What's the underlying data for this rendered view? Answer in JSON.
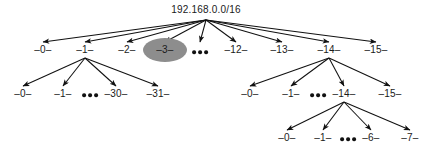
{
  "figure": {
    "title_text": "192.168.0.0/16",
    "background_color": "#ffffff",
    "ink_color": "#1a1a1a",
    "highlight_color": "#8d8d8d"
  },
  "tree": {
    "root": {
      "label": "192.168.0.0/16",
      "x": 206,
      "y": 10
    },
    "level2": [
      {
        "label": "–0–",
        "x": 43,
        "y": 50,
        "highlighted": false
      },
      {
        "label": "–1–",
        "x": 85,
        "y": 50,
        "highlighted": false
      },
      {
        "label": "–2–",
        "x": 127,
        "y": 50,
        "highlighted": false
      },
      {
        "label": "–3–",
        "x": 165,
        "y": 50,
        "highlighted": true
      },
      {
        "label": "–12–",
        "x": 236,
        "y": 50,
        "highlighted": false
      },
      {
        "label": "–13–",
        "x": 282,
        "y": 50,
        "highlighted": false
      },
      {
        "label": "–14–",
        "x": 329,
        "y": 50,
        "highlighted": false
      },
      {
        "label": "–15–",
        "x": 376,
        "y": 50,
        "highlighted": false
      }
    ],
    "level2_ellipsis": {
      "x": 200,
      "y": 52,
      "dots": 3
    },
    "level3_left": [
      {
        "label": "–0–",
        "x": 23,
        "y": 94
      },
      {
        "label": "–1–",
        "x": 63,
        "y": 94
      },
      {
        "label": "–30–",
        "x": 116,
        "y": 94
      },
      {
        "label": "–31–",
        "x": 158,
        "y": 94
      }
    ],
    "level3_left_ellipsis": {
      "x": 90,
      "y": 95,
      "dots": 3
    },
    "level3_right": [
      {
        "label": "–0–",
        "x": 250,
        "y": 94
      },
      {
        "label": "–1–",
        "x": 291,
        "y": 94
      },
      {
        "label": "–14–",
        "x": 344,
        "y": 94
      },
      {
        "label": "–15–",
        "x": 390,
        "y": 94
      }
    ],
    "level3_right_ellipsis": {
      "x": 318,
      "y": 95,
      "dots": 3
    },
    "level4": [
      {
        "label": "–0–",
        "x": 287,
        "y": 138
      },
      {
        "label": "–1–",
        "x": 323,
        "y": 138
      },
      {
        "label": "–6–",
        "x": 371,
        "y": 138
      },
      {
        "label": "–7–",
        "x": 410,
        "y": 138
      }
    ],
    "level4_ellipsis": {
      "x": 348,
      "y": 139,
      "dots": 3
    }
  },
  "edges": {
    "from_root": {
      "origin_x": 206,
      "origin_y": 20,
      "targets_y": 42
    },
    "from_level2_n1": {
      "origin_x": 85,
      "origin_y": 58,
      "targets_y": 86
    },
    "from_level2_n14": {
      "origin_x": 329,
      "origin_y": 58,
      "targets_y": 86
    },
    "from_level3_n14": {
      "origin_x": 344,
      "origin_y": 102,
      "targets_y": 130
    }
  }
}
